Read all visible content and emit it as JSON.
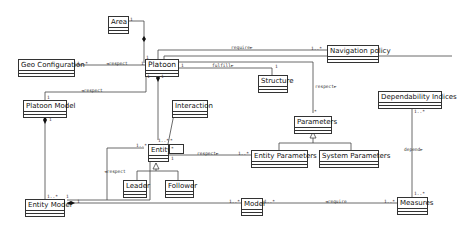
{
  "classes": {
    "area": "Area",
    "geo_configuration": "Geo Configuration",
    "platoon": "Platoon",
    "navigation_policy": "Navigation policy",
    "structure": "Structure",
    "platoon_model": "Platoon Model",
    "interaction": "Interaction",
    "parameters": "Parameters",
    "dependability_indices": "Dependability Indices",
    "entity": "Entity",
    "entity_parameters": "Entity Parameters",
    "system_parameters": "System Parameters",
    "leader": "Leader",
    "follower": "Follower",
    "entity_model": "Entity Model",
    "model": "Model",
    "measures": "Measures"
  },
  "relations": {
    "geo_respect": "◄respect",
    "require_nav": "require►",
    "fulfill": "fulfill►",
    "platoon_model_respect": "◄respect",
    "platoon_params_respect": "respect►",
    "entity_params_respect": "respect►",
    "entity_model_respect": "◄respect",
    "depend": "depend►",
    "measures_require": "◄require"
  },
  "multiplicities": {
    "area_1": "1",
    "geo_1n": "1..*",
    "platoon_geo_1": "1",
    "nav_1n": "1..*",
    "structure_1": "1",
    "platoon_top_1": "1",
    "platoon_right_1": "1",
    "platoon_bottom_1": "1",
    "platoon_bottom_1b": "1",
    "platoon_model_1": "1",
    "platoon_model_bottom_1": "1",
    "entity_1n": "1..*",
    "entity_top_n": "*",
    "entity_left_1n": "1..*",
    "entity_right_1": "1",
    "params_star": "*",
    "entity_params_1n": "1..*",
    "dep_1n": "1..*",
    "measures_top_1n": "1..*",
    "measures_left_1n": "1..*",
    "entity_model_1n": "1..*",
    "entity_model_1": "1",
    "entity_model_right_1": "1",
    "model_left_1n": "1..*",
    "model_right_1n": "1..*",
    "interaction_star": "*"
  }
}
